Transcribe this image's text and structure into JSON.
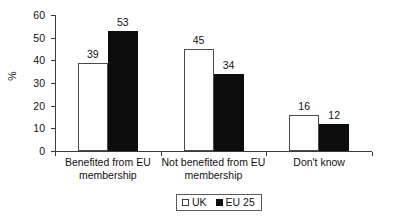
{
  "chart_data": {
    "type": "bar",
    "title": "",
    "subtitle": "",
    "xlabel": "",
    "ylabel": "%",
    "ylim": [
      0,
      60
    ],
    "yticks": [
      0,
      10,
      20,
      30,
      40,
      50,
      60
    ],
    "ytick_labels": [
      "0",
      "10",
      "20",
      "30",
      "40",
      "50",
      "60"
    ],
    "grid": false,
    "legend_position": "bottom-center",
    "categories": [
      "Benefited from EU membership",
      "Not benefited from EU membership",
      "Don't know"
    ],
    "category_lines": [
      [
        "Benefited from EU",
        "membership"
      ],
      [
        "Not benefited from EU",
        "membership"
      ],
      [
        "Don't know",
        ""
      ]
    ],
    "series": [
      {
        "name": "UK",
        "color": "#ffffff",
        "edge_color": "#4a4a4a",
        "values": [
          39,
          45,
          16
        ],
        "labels": [
          "39",
          "45",
          "16"
        ]
      },
      {
        "name": "EU 25",
        "color": "#0d0d0d",
        "edge_color": "#0d0d0d",
        "values": [
          53,
          34,
          12
        ],
        "labels": [
          "53",
          "34",
          "12"
        ]
      }
    ]
  },
  "legend": {
    "items": [
      {
        "label": "UK",
        "swatch": "open-square-swatch"
      },
      {
        "label": "EU 25",
        "swatch": "filled-square-swatch"
      }
    ]
  },
  "axis": {
    "y_title": "%"
  }
}
